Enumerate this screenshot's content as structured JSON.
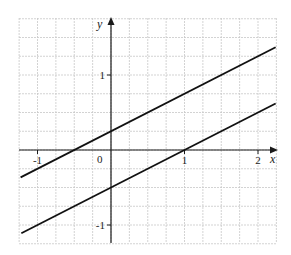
{
  "chart_data": {
    "type": "line",
    "title": "",
    "xlabel": "x",
    "ylabel": "y",
    "xlim": [
      -1.25,
      2.25
    ],
    "ylim": [
      -1.25,
      1.75
    ],
    "grid": true,
    "grid_spacing": 0.25,
    "x_ticks": [
      {
        "value": -1,
        "label": "-1"
      },
      {
        "value": 0,
        "label": "0"
      },
      {
        "value": 1,
        "label": "1"
      },
      {
        "value": 2,
        "label": "2"
      }
    ],
    "y_ticks": [
      {
        "value": 1,
        "label": "1"
      },
      {
        "value": -1,
        "label": "-1"
      }
    ],
    "series": [
      {
        "name": "line-upper",
        "equation": "y = 0.5x + 0.25",
        "slope": 0.5,
        "intercept": 0.25,
        "x": [
          -1.23,
          2.24
        ],
        "y": [
          -0.365,
          1.37
        ]
      },
      {
        "name": "line-lower",
        "equation": "y = 0.5x - 0.5",
        "slope": 0.5,
        "intercept": -0.5,
        "x": [
          -1.22,
          2.24
        ],
        "y": [
          -1.11,
          0.62
        ]
      }
    ],
    "legend": null
  },
  "labels": {
    "x_axis": "x",
    "y_axis": "y",
    "origin": "0"
  },
  "colors": {
    "grid": "#c8c8c8",
    "axis": "#1a1a1a",
    "line": "#111111"
  }
}
